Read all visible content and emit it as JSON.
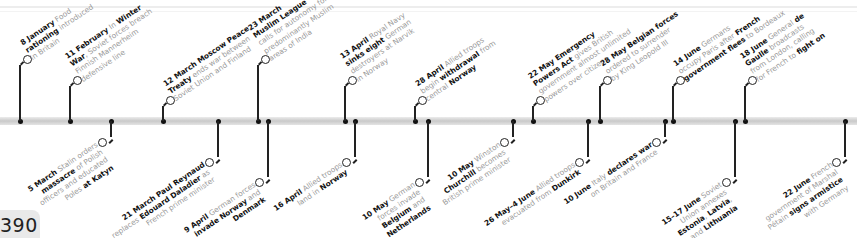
{
  "page": {
    "number": "390"
  },
  "colors": {
    "bold_text": "#111111",
    "body_text": "#9a9a9a",
    "bar": "#cfcfcf",
    "line": "#222222"
  },
  "timeline": {
    "year": "1940",
    "top_events": [
      {
        "tick_x": 20,
        "node_y": 59,
        "lines": [
          [
            [
              "b",
              "8 January"
            ],
            [
              "t",
              " Food"
            ]
          ],
          [
            [
              "b",
              "rationing"
            ],
            [
              "t",
              " introduced"
            ]
          ],
          [
            [
              "t",
              "in Britain"
            ]
          ]
        ]
      },
      {
        "tick_x": 70,
        "node_y": 80,
        "lines": [
          [
            [
              "b",
              "11 February"
            ],
            [
              "t",
              " In "
            ],
            [
              "b",
              "Winter"
            ]
          ],
          [
            [
              "b",
              "War"
            ],
            [
              "t",
              ", Soviet forces breach"
            ]
          ],
          [
            [
              "t",
              "Finnish Mannerheim"
            ]
          ],
          [
            [
              "t",
              "defensive line"
            ]
          ]
        ]
      },
      {
        "tick_x": 163,
        "node_y": 100,
        "lines": [
          [
            [
              "b",
              "12 March Moscow Peace"
            ]
          ],
          [
            [
              "b",
              "Treaty"
            ],
            [
              "t",
              " ends war between"
            ]
          ],
          [
            [
              "t",
              "Soviet Union and Finland"
            ]
          ]
        ]
      },
      {
        "tick_x": 258,
        "node_y": 59,
        "lines": [
          [
            [
              "b",
              "23 March"
            ]
          ],
          [
            [
              "b",
              "Muslim League"
            ]
          ],
          [
            [
              "t",
              "calls for autonomy for"
            ]
          ],
          [
            [
              "t",
              "predominantly Muslim"
            ]
          ],
          [
            [
              "t",
              "areas of India"
            ]
          ]
        ]
      },
      {
        "tick_x": 345,
        "node_y": 80,
        "lines": [
          [
            [
              "b",
              "13 April"
            ],
            [
              "t",
              " Royal Navy"
            ]
          ],
          [
            [
              "b",
              "sinks eight"
            ],
            [
              "t",
              " German"
            ]
          ],
          [
            [
              "t",
              "destroyers at Narvik"
            ]
          ],
          [
            [
              "t",
              "in Norway"
            ]
          ]
        ]
      },
      {
        "tick_x": 415,
        "node_y": 100,
        "lines": [
          [
            [
              "b",
              "28 April"
            ],
            [
              "t",
              " Allied troops"
            ]
          ],
          [
            [
              "t",
              "begin "
            ],
            [
              "b",
              "withdrawal"
            ],
            [
              "t",
              " from"
            ]
          ],
          [
            [
              "t",
              "central "
            ],
            [
              "b",
              "Norway"
            ]
          ]
        ]
      },
      {
        "tick_x": 533,
        "node_y": 100,
        "lines": [
          [
            [
              "b",
              "22 May Emergency"
            ]
          ],
          [
            [
              "b",
              "Powers Act"
            ],
            [
              "t",
              " gives British"
            ]
          ],
          [
            [
              "t",
              "government almost unlimited"
            ]
          ],
          [
            [
              "t",
              "powers over citizens"
            ]
          ]
        ]
      },
      {
        "tick_x": 600,
        "node_y": 80,
        "lines": [
          [
            [
              "b",
              "28 May Belgian forces"
            ]
          ],
          [
            [
              "t",
              "ordered to surrender"
            ]
          ],
          [
            [
              "t",
              "by King Leopold III"
            ]
          ]
        ]
      },
      {
        "tick_x": 673,
        "node_y": 80,
        "lines": [
          [
            [
              "b",
              "14 June"
            ],
            [
              "t",
              " Germans"
            ]
          ],
          [
            [
              "t",
              "occupy Paris after "
            ],
            [
              "b",
              "French"
            ]
          ],
          [
            [
              "b",
              "government flees"
            ],
            [
              "t",
              " to Bordeaux"
            ]
          ]
        ]
      },
      {
        "tick_x": 745,
        "node_y": 80,
        "lines": [
          [
            [
              "b",
              "18 June"
            ],
            [
              "t",
              " General "
            ],
            [
              "b",
              "de"
            ]
          ],
          [
            [
              "b",
              "Gaulle"
            ],
            [
              "t",
              " broadcasts"
            ]
          ],
          [
            [
              "t",
              "from London, calling"
            ]
          ],
          [
            [
              "t",
              "for French to "
            ],
            [
              "b",
              "fight on"
            ]
          ]
        ]
      }
    ],
    "bottom_events": [
      {
        "tick_x": 111,
        "node_y": 142,
        "lines": [
          [
            [
              "b",
              "5 March"
            ],
            [
              "t",
              " Stalin orders"
            ]
          ],
          [
            [
              "b",
              "massacre"
            ],
            [
              "t",
              " of Polish"
            ]
          ],
          [
            [
              "t",
              "officers and educated"
            ]
          ],
          [
            [
              "t",
              "Poles "
            ],
            [
              "b",
              "at Katyn"
            ]
          ]
        ]
      },
      {
        "tick_x": 218,
        "node_y": 162,
        "lines": [
          [
            [
              "b",
              "21 March Paul Reynaud"
            ]
          ],
          [
            [
              "t",
              "replaces "
            ],
            [
              "b",
              "Edouard Daladier"
            ],
            [
              "t",
              " as"
            ]
          ],
          [
            [
              "t",
              "French prime minister"
            ]
          ]
        ]
      },
      {
        "tick_x": 268,
        "node_y": 182,
        "lines": [
          [
            [
              "b",
              "9 April"
            ],
            [
              "t",
              " German forces"
            ]
          ],
          [
            [
              "b",
              "invade Norway"
            ],
            [
              "t",
              " and"
            ]
          ],
          [
            [
              "b",
              "Denmark"
            ]
          ]
        ]
      },
      {
        "tick_x": 355,
        "node_y": 162,
        "lines": [
          [
            [
              "b",
              "16 April"
            ],
            [
              "t",
              " Allied troops"
            ]
          ],
          [
            [
              "t",
              "land in "
            ],
            [
              "b",
              "Norway"
            ]
          ]
        ]
      },
      {
        "tick_x": 428,
        "node_y": 182,
        "lines": [
          [
            [
              "b",
              "10 May"
            ],
            [
              "t",
              " German"
            ]
          ],
          [
            [
              "t",
              "forces invade"
            ]
          ],
          [
            [
              "b",
              "Belgium"
            ],
            [
              "t",
              " and"
            ]
          ],
          [
            [
              "b",
              "Netherlands"
            ]
          ]
        ]
      },
      {
        "tick_x": 513,
        "node_y": 142,
        "lines": [
          [
            [
              "b",
              "10 May"
            ],
            [
              "t",
              " Winston"
            ]
          ],
          [
            [
              "b",
              "Churchill"
            ],
            [
              "t",
              " becomes"
            ]
          ],
          [
            [
              "t",
              "British prime minister"
            ]
          ]
        ]
      },
      {
        "tick_x": 588,
        "node_y": 162,
        "lines": [
          [
            [
              "b",
              "26 May–4 June"
            ],
            [
              "t",
              " Allied troops"
            ]
          ],
          [
            [
              "t",
              "evacuated from "
            ],
            [
              "b",
              "Dunkirk"
            ]
          ]
        ]
      },
      {
        "tick_x": 665,
        "node_y": 142,
        "lines": [
          [
            [
              "b",
              "10 June"
            ],
            [
              "t",
              " Italy "
            ],
            [
              "b",
              "declares war"
            ]
          ],
          [
            [
              "t",
              "on Britain and France"
            ]
          ]
        ]
      },
      {
        "tick_x": 735,
        "node_y": 182,
        "lines": [
          [
            [
              "b",
              "15–17 June"
            ],
            [
              "t",
              " Soviet"
            ]
          ],
          [
            [
              "t",
              "Union annexes"
            ]
          ],
          [
            [
              "b",
              "Estonia"
            ],
            [
              "t",
              ", "
            ],
            [
              "b",
              "Latvia"
            ],
            [
              "t",
              ","
            ]
          ],
          [
            [
              "t",
              "and "
            ],
            [
              "b",
              "Lithuania"
            ]
          ]
        ]
      },
      {
        "tick_x": 845,
        "node_y": 162,
        "lines": [
          [
            [
              "b",
              "22 June"
            ],
            [
              "t",
              " French"
            ]
          ],
          [
            [
              "t",
              "government of Marshal"
            ]
          ],
          [
            [
              "t",
              "Pétain "
            ],
            [
              "b",
              "signs armistice"
            ]
          ],
          [
            [
              "t",
              "with Germany"
            ]
          ]
        ]
      }
    ]
  }
}
